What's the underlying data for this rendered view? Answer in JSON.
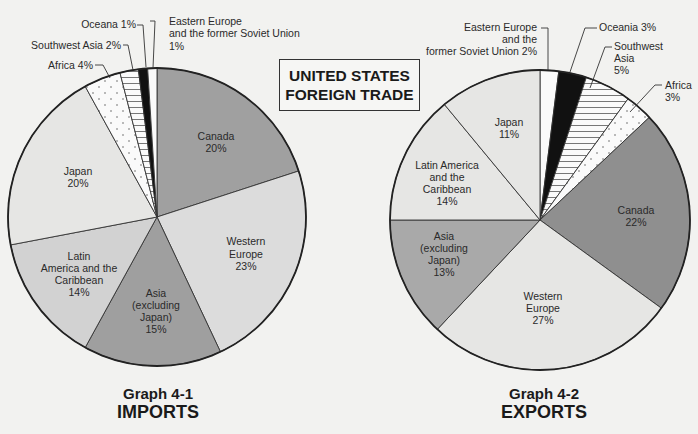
{
  "title": {
    "line1": "UNITED STATES",
    "line2": "FOREIGN TRADE"
  },
  "captions": {
    "imports": {
      "graph": "Graph 4-1",
      "name": "IMPORTS"
    },
    "exports": {
      "graph": "Graph 4-2",
      "name": "EXPORTS"
    }
  },
  "colors": {
    "dark_gray": "#8c8c8c",
    "mid_gray": "#bdbdbd",
    "light_gray": "#dcdcdc",
    "lighter_gray": "#e6e6e4",
    "black": "#111111",
    "white": "#fafafa"
  },
  "chart_data": [
    {
      "type": "pie",
      "title": "Graph 4-1 IMPORTS",
      "categories": [
        "Canada",
        "Western Europe",
        "Asia (excluding Japan)",
        "Latin America and the Caribbean",
        "Japan",
        "Africa",
        "Southwest Asia",
        "Oceana",
        "Eastern Europe and the former Soviet Union"
      ],
      "values": [
        20,
        23,
        15,
        14,
        20,
        4,
        2,
        1,
        1
      ],
      "unit": "%"
    },
    {
      "type": "pie",
      "title": "Graph 4-2 EXPORTS",
      "categories": [
        "Eastern Europe and the former Soviet Union",
        "Oceania",
        "Southwest Asia",
        "Africa",
        "Canada",
        "Western Europe",
        "Asia (excluding Japan)",
        "Latin America and the Caribbean",
        "Japan"
      ],
      "values": [
        2,
        3,
        5,
        3,
        22,
        27,
        13,
        14,
        11
      ],
      "unit": "%"
    }
  ],
  "labels": {
    "imports": {
      "oceana": "Oceana 1%",
      "eeurope1": "Eastern Europe",
      "eeurope2": "and the former Soviet Union",
      "eeurope3": "1%",
      "swasia": "Southwest Asia 2%",
      "africa": "Africa 4%",
      "canada1": "Canada",
      "canada2": "20%",
      "weurope1": "Western",
      "weurope2": "Europe",
      "weurope3": "23%",
      "asia1": "Asia",
      "asia2": "(excluding",
      "asia3": "Japan)",
      "asia4": "15%",
      "latin1": "Latin",
      "latin2": "America and the",
      "latin3": "Caribbean",
      "latin4": "14%",
      "japan1": "Japan",
      "japan2": "20%"
    },
    "exports": {
      "eeurope1": "Eastern Europe",
      "eeurope2": "and the",
      "eeurope3": "former Soviet Union 2%",
      "oceania": "Oceania 3%",
      "swasia1": "Southwest",
      "swasia2": "Asia",
      "swasia3": "5%",
      "africa1": "Africa",
      "africa2": "3%",
      "japan1": "Japan",
      "japan2": "11%",
      "latin1": "Latin America",
      "latin2": "and the",
      "latin3": "Caribbean",
      "latin4": "14%",
      "asia1": "Asia",
      "asia2": "(excluding",
      "asia3": "Japan)",
      "asia4": "13%",
      "canada1": "Canada",
      "canada2": "22%",
      "weurope1": "Western",
      "weurope2": "Europe",
      "weurope3": "27%"
    }
  }
}
